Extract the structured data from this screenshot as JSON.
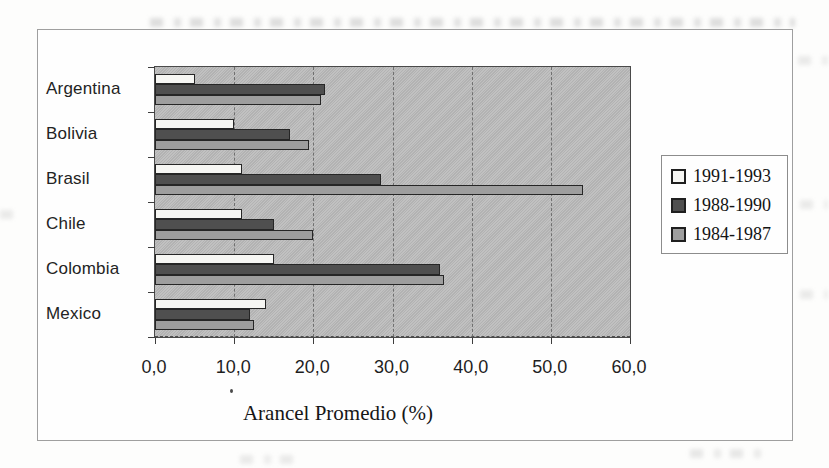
{
  "page": {
    "kind": "scanned document figure",
    "background_color": "#fdfdfc"
  },
  "chart_data": {
    "type": "bar",
    "orientation": "horizontal",
    "title": "",
    "xlabel": "Arancel Promedio (%)",
    "categories": [
      "Argentina",
      "Bolivia",
      "Brasil",
      "Chile",
      "Colombia",
      "Mexico"
    ],
    "series": [
      {
        "name": "1991-1993",
        "color": "#f6f6f3",
        "values": [
          5.0,
          10.0,
          11.0,
          11.0,
          15.0,
          14.0
        ]
      },
      {
        "name": "1988-1990",
        "color": "#4f4f4f",
        "values": [
          21.5,
          17.0,
          28.5,
          15.0,
          36.0,
          12.0
        ]
      },
      {
        "name": "1984-1987",
        "color": "#9e9e9e",
        "values": [
          21.0,
          19.5,
          54.0,
          20.0,
          36.5,
          12.5
        ]
      }
    ],
    "xlim": [
      0,
      60
    ],
    "xticks": {
      "values": [
        0,
        10,
        20,
        30,
        40,
        50,
        60
      ],
      "labels": [
        "0,0",
        "10,0",
        "20,0",
        "30,0",
        "40,0",
        "50,0",
        "60,0"
      ]
    },
    "grid": "vertical dashed gridlines every 10",
    "plot_background_color": "#bcbcbc",
    "legend_position": "right",
    "legend_entries": [
      "1991-1993",
      "1988-1990",
      "1984-1987"
    ]
  }
}
